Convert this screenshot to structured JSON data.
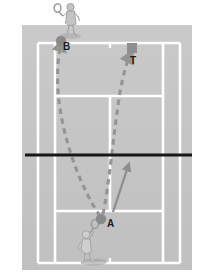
{
  "diagram": {
    "labels": {
      "ball_start": "A",
      "ball_end": "B",
      "target": "T"
    },
    "colors": {
      "page_background": "#ffffff",
      "court_surface": "#c6c6c6",
      "court_surface_shade": "#bfbfbf",
      "court_line": "#ffffff",
      "net_line": "#161616",
      "ball": "#8a8a8a",
      "trajectory": "#949494",
      "movement_arrow": "#8e8e8e",
      "target_square": "#8e8e8e",
      "player": "#b3b3b3",
      "player_outline": "#8d8d8d",
      "shadow": "#a3a3a3",
      "label_text": "#1d1d1d"
    },
    "court": {
      "surface_left": 22,
      "surface_top": 25,
      "surface_right": 192,
      "surface_bottom": 270,
      "doubles_left": 38,
      "doubles_right": 180,
      "singles_left": 55,
      "singles_right": 163,
      "baseline_top": 43,
      "baseline_bottom": 263,
      "service_line_top": 96,
      "service_line_bottom": 211,
      "center_service_line_x": 110,
      "net_y": 155,
      "net_left": 25,
      "net_right": 192,
      "line_width": 2.6
    },
    "markers": {
      "ball_a": {
        "cx": 101,
        "cy": 219,
        "r": 5.2
      },
      "ball_b": {
        "cx": 61,
        "cy": 41,
        "r": 5.2
      },
      "target_square": {
        "x": 127,
        "y": 43,
        "size": 10
      }
    },
    "players": [
      {
        "name": "top-player",
        "x": 66,
        "y": 4,
        "facing": "down"
      },
      {
        "name": "bottom-player",
        "x": 85,
        "y": 228,
        "facing": "up"
      }
    ],
    "paths": {
      "shot_to_b": {
        "name": "ball-path-a-to-b",
        "style": "dashed",
        "from": "A",
        "to": "B",
        "arrowhead_at": "B"
      },
      "shot_to_t": {
        "name": "ball-path-a-to-t",
        "style": "dashed",
        "from": "A",
        "to": "T",
        "arrowhead_at": "T"
      },
      "player_movement": {
        "name": "player-movement-arrow",
        "style": "solid",
        "from_x": 113,
        "from_y": 212,
        "to_x": 128,
        "to_y": 166
      }
    }
  }
}
